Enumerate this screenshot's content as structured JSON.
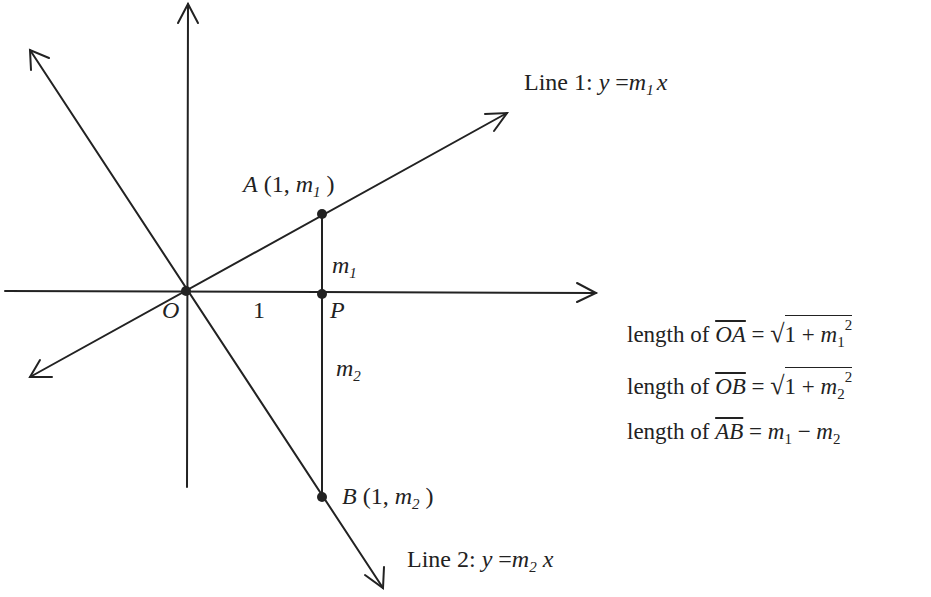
{
  "diagram": {
    "points": {
      "O": {
        "label": "O",
        "x": 186,
        "y": 291
      },
      "A": {
        "label": "A",
        "coords_text": "(1, ",
        "coord_var": "m",
        "coord_sub": "1",
        "close": " )",
        "x": 322,
        "y": 214
      },
      "P": {
        "label": "P",
        "x": 322,
        "y": 294
      },
      "B": {
        "label": "B",
        "coords_text": "(1, ",
        "coord_var": "m",
        "coord_sub": "2",
        "close": " )",
        "x": 322,
        "y": 497
      }
    },
    "unit_label": "1",
    "segment_labels": {
      "m1": {
        "var": "m",
        "sub": "1"
      },
      "m2": {
        "var": "m",
        "sub": "2"
      }
    },
    "line1": {
      "prefix": "Line 1: ",
      "y": "y",
      "eq": " =",
      "m": "m",
      "sub": "1",
      "x": "x"
    },
    "line2": {
      "prefix": "Line 2: ",
      "y": "y",
      "eq": " =",
      "m": "m",
      "sub": "2",
      "x": " x"
    },
    "equations": [
      {
        "lhs": "length  of ",
        "seg": "OA",
        "eq": " = ",
        "rhs_type": "sqrt",
        "one": "1 + ",
        "m": "m",
        "sub": "1",
        "pow": "2"
      },
      {
        "lhs": "length  of ",
        "seg": "OB",
        "eq": " = ",
        "rhs_type": "sqrt",
        "one": "1 + ",
        "m": "m",
        "sub": "2",
        "pow": "2"
      },
      {
        "lhs": "length  of ",
        "seg": "AB",
        "eq": " = ",
        "rhs_type": "diff",
        "m": "m",
        "sub1": "1",
        "minus": " − ",
        "sub2": "2"
      }
    ],
    "colors": {
      "ink": "#222222",
      "background": "#ffffff"
    }
  }
}
